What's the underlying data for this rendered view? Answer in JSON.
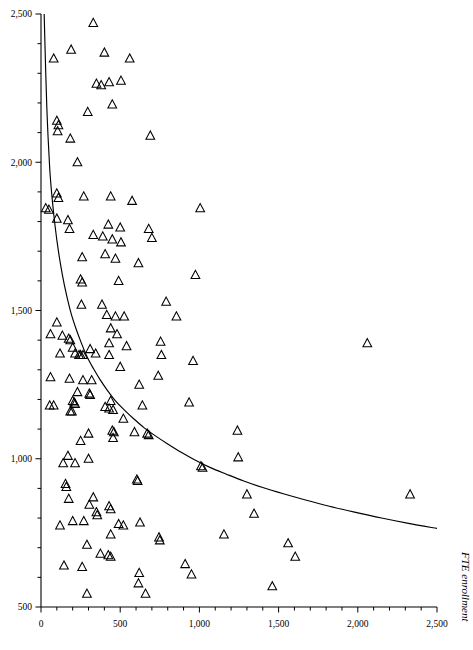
{
  "chart_data": {
    "type": "scatter",
    "title": "",
    "subtitle": "",
    "xlabel": "",
    "ylabel": "FTE enrollment",
    "ylabel_position": "right-rotated",
    "xlim": [
      0,
      2500
    ],
    "ylim": [
      500,
      2500
    ],
    "grid": false,
    "legend": null,
    "marker": "open-triangle-up",
    "marker_color": "#000000",
    "xticks": [
      0,
      500,
      1000,
      1500,
      2000,
      2500
    ],
    "xtick_labels": [
      "0",
      "500",
      "1,000",
      "1,500",
      "2,000",
      "2,500"
    ],
    "xticks_minor_step": 100,
    "yticks": [
      500,
      1000,
      1500,
      2000,
      2500
    ],
    "ytick_labels": [
      "500",
      "1,000",
      "1,500",
      "2,000",
      "2,500"
    ],
    "yticks_minor_step": 100,
    "series": [
      {
        "name": "institutions",
        "marker": "open-triangle-up",
        "points": [
          [
            330,
            2470
          ],
          [
            190,
            2380
          ],
          [
            400,
            2370
          ],
          [
            80,
            2350
          ],
          [
            560,
            2350
          ],
          [
            430,
            2270
          ],
          [
            350,
            2265
          ],
          [
            380,
            2260
          ],
          [
            505,
            2275
          ],
          [
            450,
            2195
          ],
          [
            295,
            2170
          ],
          [
            100,
            2140
          ],
          [
            110,
            2125
          ],
          [
            105,
            2105
          ],
          [
            185,
            2080
          ],
          [
            690,
            2090
          ],
          [
            230,
            2000
          ],
          [
            100,
            1895
          ],
          [
            270,
            1885
          ],
          [
            440,
            1885
          ],
          [
            110,
            1880
          ],
          [
            575,
            1870
          ],
          [
            30,
            1845
          ],
          [
            50,
            1840
          ],
          [
            100,
            1810
          ],
          [
            170,
            1805
          ],
          [
            1005,
            1845
          ],
          [
            180,
            1775
          ],
          [
            425,
            1790
          ],
          [
            500,
            1780
          ],
          [
            680,
            1775
          ],
          [
            330,
            1755
          ],
          [
            390,
            1750
          ],
          [
            450,
            1740
          ],
          [
            505,
            1730
          ],
          [
            700,
            1745
          ],
          [
            260,
            1680
          ],
          [
            405,
            1690
          ],
          [
            470,
            1675
          ],
          [
            615,
            1660
          ],
          [
            250,
            1605
          ],
          [
            260,
            1595
          ],
          [
            490,
            1600
          ],
          [
            975,
            1620
          ],
          [
            255,
            1520
          ],
          [
            385,
            1520
          ],
          [
            790,
            1530
          ],
          [
            415,
            1485
          ],
          [
            470,
            1480
          ],
          [
            525,
            1480
          ],
          [
            100,
            1460
          ],
          [
            480,
            1420
          ],
          [
            855,
            1480
          ],
          [
            60,
            1420
          ],
          [
            135,
            1415
          ],
          [
            175,
            1405
          ],
          [
            185,
            1400
          ],
          [
            440,
            1440
          ],
          [
            200,
            1375
          ],
          [
            310,
            1370
          ],
          [
            430,
            1390
          ],
          [
            540,
            1380
          ],
          [
            2060,
            1390
          ],
          [
            120,
            1355
          ],
          [
            215,
            1355
          ],
          [
            240,
            1350
          ],
          [
            250,
            1350
          ],
          [
            265,
            1350
          ],
          [
            345,
            1355
          ],
          [
            430,
            1350
          ],
          [
            755,
            1395
          ],
          [
            760,
            1350
          ],
          [
            960,
            1330
          ],
          [
            500,
            1310
          ],
          [
            60,
            1275
          ],
          [
            180,
            1270
          ],
          [
            265,
            1265
          ],
          [
            320,
            1265
          ],
          [
            620,
            1250
          ],
          [
            740,
            1280
          ],
          [
            230,
            1225
          ],
          [
            305,
            1220
          ],
          [
            310,
            1215
          ],
          [
            440,
            1195
          ],
          [
            55,
            1180
          ],
          [
            80,
            1180
          ],
          [
            200,
            1195
          ],
          [
            210,
            1190
          ],
          [
            215,
            1185
          ],
          [
            185,
            1160
          ],
          [
            195,
            1160
          ],
          [
            405,
            1175
          ],
          [
            430,
            1170
          ],
          [
            455,
            1165
          ],
          [
            640,
            1180
          ],
          [
            935,
            1190
          ],
          [
            520,
            1135
          ],
          [
            300,
            1085
          ],
          [
            450,
            1095
          ],
          [
            460,
            1090
          ],
          [
            455,
            1070
          ],
          [
            590,
            1090
          ],
          [
            670,
            1085
          ],
          [
            680,
            1080
          ],
          [
            1240,
            1095
          ],
          [
            250,
            1060
          ],
          [
            170,
            1010
          ],
          [
            1245,
            1005
          ],
          [
            300,
            1000
          ],
          [
            140,
            985
          ],
          [
            215,
            985
          ],
          [
            1010,
            975
          ],
          [
            1020,
            970
          ],
          [
            605,
            930
          ],
          [
            610,
            925
          ],
          [
            155,
            915
          ],
          [
            160,
            905
          ],
          [
            175,
            865
          ],
          [
            330,
            870
          ],
          [
            1300,
            880
          ],
          [
            305,
            845
          ],
          [
            350,
            820
          ],
          [
            355,
            810
          ],
          [
            430,
            840
          ],
          [
            440,
            830
          ],
          [
            1345,
            815
          ],
          [
            200,
            790
          ],
          [
            270,
            790
          ],
          [
            490,
            780
          ],
          [
            520,
            775
          ],
          [
            625,
            785
          ],
          [
            2330,
            880
          ],
          [
            120,
            775
          ],
          [
            440,
            745
          ],
          [
            745,
            735
          ],
          [
            750,
            725
          ],
          [
            1155,
            745
          ],
          [
            290,
            710
          ],
          [
            1560,
            715
          ],
          [
            375,
            680
          ],
          [
            425,
            675
          ],
          [
            440,
            670
          ],
          [
            1605,
            670
          ],
          [
            145,
            640
          ],
          [
            260,
            635
          ],
          [
            910,
            645
          ],
          [
            620,
            615
          ],
          [
            950,
            610
          ],
          [
            615,
            580
          ],
          [
            1460,
            570
          ],
          [
            290,
            545
          ],
          [
            660,
            545
          ]
        ]
      }
    ],
    "fit_curve": {
      "name": "fitted-decay-curve",
      "style": "solid",
      "color": "#000000",
      "points": [
        [
          20,
          2500
        ],
        [
          30,
          2300
        ],
        [
          40,
          2140
        ],
        [
          55,
          1980
        ],
        [
          70,
          1880
        ],
        [
          90,
          1780
        ],
        [
          110,
          1700
        ],
        [
          135,
          1620
        ],
        [
          160,
          1555
        ],
        [
          190,
          1490
        ],
        [
          220,
          1440
        ],
        [
          255,
          1390
        ],
        [
          290,
          1345
        ],
        [
          330,
          1305
        ],
        [
          375,
          1265
        ],
        [
          420,
          1230
        ],
        [
          470,
          1195
        ],
        [
          525,
          1165
        ],
        [
          585,
          1135
        ],
        [
          650,
          1105
        ],
        [
          720,
          1078
        ],
        [
          800,
          1050
        ],
        [
          885,
          1022
        ],
        [
          975,
          995
        ],
        [
          1070,
          970
        ],
        [
          1170,
          948
        ],
        [
          1280,
          925
        ],
        [
          1400,
          903
        ],
        [
          1530,
          882
        ],
        [
          1670,
          861
        ],
        [
          1820,
          840
        ],
        [
          1980,
          820
        ],
        [
          2150,
          800
        ],
        [
          2320,
          782
        ],
        [
          2500,
          765
        ]
      ]
    }
  },
  "axes": {
    "x_axis_name": "x-axis",
    "y_axis_name": "y-axis",
    "right_label": "FTE enrollment"
  }
}
